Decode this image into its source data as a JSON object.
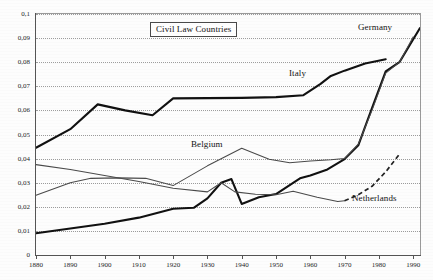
{
  "chart_data": {
    "type": "line",
    "title": "Civil Law Countries",
    "xlabel": "",
    "ylabel": "",
    "xlim": [
      1880,
      1992
    ],
    "ylim": [
      0,
      0.1
    ],
    "grid": true,
    "legend_position": "inline-labels",
    "decimal_separator": ",",
    "y_ticks": [
      0,
      0.01,
      0.02,
      0.03,
      0.04,
      0.05,
      0.06,
      0.07,
      0.08,
      0.09,
      0.1
    ],
    "y_tick_labels": [
      "0",
      "0,01",
      "0,02",
      "0,03",
      "0,04",
      "0,05",
      "0,06",
      "0,07",
      "0,08",
      "0,09",
      "0,1"
    ],
    "x_ticks": [
      1880,
      1890,
      1900,
      1910,
      1920,
      1930,
      1940,
      1950,
      1960,
      1970,
      1980,
      1990
    ],
    "x_tick_labels": [
      "1880",
      "1890",
      "1900",
      "1910",
      "1920",
      "1930",
      "1940",
      "1950",
      "1960",
      "1970",
      "1980",
      "1990"
    ],
    "series": [
      {
        "name": "Italy",
        "style": "thick-solid",
        "label_x": 1938,
        "label_y": 0.0755,
        "x": [
          1880,
          1890,
          1898,
          1906,
          1914,
          1920,
          1930,
          1940,
          1950,
          1958,
          1963,
          1966,
          1970,
          1976,
          1982
        ],
        "values": [
          0.0445,
          0.0522,
          0.0625,
          0.06,
          0.058,
          0.065,
          0.0651,
          0.0652,
          0.0655,
          0.0663,
          0.071,
          0.0743,
          0.0765,
          0.0795,
          0.0812
        ]
      },
      {
        "name": "Germany",
        "style": "thick-solid",
        "label_x": 1981,
        "label_y": 0.0935,
        "x": [
          1880,
          1890,
          1900,
          1910,
          1920,
          1926,
          1930,
          1934,
          1937,
          1940,
          1945,
          1950,
          1954,
          1957,
          1960,
          1965,
          1970,
          1974,
          1978,
          1982,
          1986,
          1992
        ],
        "values": [
          0.009,
          0.011,
          0.013,
          0.0155,
          0.0192,
          0.0196,
          0.0235,
          0.03,
          0.0315,
          0.0212,
          0.024,
          0.0253,
          0.029,
          0.0318,
          0.033,
          0.0355,
          0.0398,
          0.0455,
          0.061,
          0.0762,
          0.08,
          0.0942
        ]
      },
      {
        "name": "Belgium",
        "style": "thin-solid",
        "label_x": 1928,
        "label_y": 0.0448,
        "x": [
          1880,
          1890,
          1896,
          1904,
          1912,
          1920,
          1930,
          1940,
          1948,
          1954,
          1960,
          1966,
          1970,
          1974,
          1978,
          1982,
          1986,
          1990
        ],
        "values": [
          0.0248,
          0.03,
          0.0318,
          0.032,
          0.0318,
          0.0288,
          0.037,
          0.0443,
          0.0397,
          0.0383,
          0.039,
          0.0395,
          0.04,
          0.046,
          0.06,
          0.0755,
          0.08,
          0.0905
        ]
      },
      {
        "name": "Netherlands",
        "style": "thin-solid-then-dashed",
        "dash_starts_at": 1970,
        "label_x": 1978,
        "label_y": 0.0238,
        "x": [
          1880,
          1890,
          1900,
          1910,
          1920,
          1930,
          1934,
          1938,
          1944,
          1950,
          1955,
          1962,
          1968,
          1970,
          1974,
          1978,
          1982,
          1986
        ],
        "values": [
          0.0375,
          0.0355,
          0.033,
          0.0305,
          0.0277,
          0.0262,
          0.03,
          0.0262,
          0.0252,
          0.025,
          0.0265,
          0.024,
          0.0222,
          0.0225,
          0.025,
          0.0285,
          0.0345,
          0.0418
        ]
      }
    ]
  },
  "labels": {
    "title_box": "Civil Law Countries",
    "germany": "Germany",
    "italy": "Italy",
    "belgium": "Belgium",
    "netherlands": "Netherlands"
  }
}
